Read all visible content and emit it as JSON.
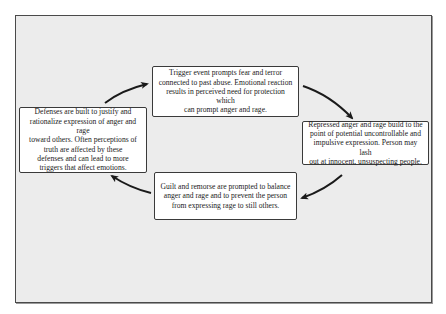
{
  "diagram": {
    "type": "cycle",
    "boxes": {
      "top": {
        "lines": [
          "Trigger event prompts fear and terror",
          "connected to past abuse. Emotional reaction",
          "results in perceived need for protection which",
          "can prompt anger and rage."
        ]
      },
      "right": {
        "lines": [
          "Repressed anger and rage build to the",
          "point of potential uncontrollable and",
          "impulsive expression. Person may lash",
          "out at innocent, unsuspecting people."
        ]
      },
      "bottom": {
        "lines": [
          "Guilt and remorse are prompted to balance",
          "anger and rage and to prevent the person",
          "from expressing rage to still others."
        ]
      },
      "left": {
        "lines": [
          "Defenses are built to justify and",
          "rationalize expression of anger and rage",
          "toward others. Often perceptions of",
          "truth are affected by these",
          "defenses and can lead to more",
          "triggers that affect emotions."
        ]
      }
    },
    "arrows": [
      {
        "from": "top",
        "to": "right"
      },
      {
        "from": "right",
        "to": "bottom"
      },
      {
        "from": "bottom",
        "to": "left"
      },
      {
        "from": "left",
        "to": "top"
      }
    ],
    "colors": {
      "frame_background": "#ececec",
      "frame_border": "#4a4a4a",
      "box_background": "#ffffff",
      "box_border": "#3a3a3a",
      "arrow": "#1a1a1a",
      "text": "#222222"
    }
  }
}
